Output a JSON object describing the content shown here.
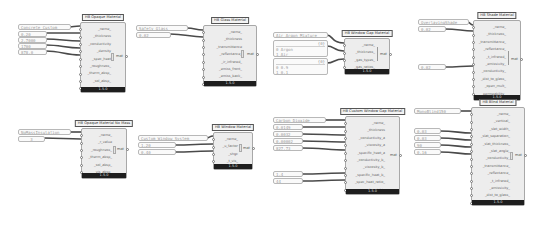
{
  "canvas": {
    "background": "#ffffff",
    "wire_color": "#4a4a4a"
  },
  "components": [
    {
      "id": "opaque",
      "title": "HB Opaque Material",
      "inputs": [
        "_name_",
        "_thickness",
        "_conductivity",
        "_density",
        "_spec_heat",
        "_roughness_",
        "_therm_absp_",
        "_sol_absp_",
        "_vis_absp_"
      ],
      "output": "mat",
      "version": "1.5.0"
    },
    {
      "id": "glass",
      "title": "HB Glass Material",
      "inputs": [
        "_name_",
        "_thickness",
        "_transmittance",
        "_reflectance_",
        "_ir_infrared_",
        "_emiss_front_",
        "_emiss_back_",
        "_conductivity_"
      ],
      "output": "mat",
      "version": "1.5.0"
    },
    {
      "id": "gap",
      "title": "HB Window Gap Material",
      "inputs": [
        "_name_",
        "_thickness_",
        "_gas_types_",
        "_gas_ratios_"
      ],
      "output": "mat",
      "version": "1.5.0"
    },
    {
      "id": "shade",
      "title": "HB Shade Material",
      "inputs": [
        "_name_",
        "_thickness_",
        "_transmittance_",
        "_reflectance_",
        "_t_infrared_",
        "_emissivity_",
        "_conductivity_",
        "_dist_to_glass_",
        "_open_mult_",
        "_permeability_"
      ],
      "output": "mat",
      "version": "1.5.0"
    },
    {
      "id": "opaque_nomass",
      "title": "HB Opaque Material No Mass",
      "inputs": [
        "_name_",
        "_r_value",
        "_roughness_",
        "_therm_absp_",
        "_sol_absp_",
        "_vis_absp_"
      ],
      "output": "mat",
      "version": "1.5.0"
    },
    {
      "id": "window",
      "title": "HB Window Material",
      "inputs": [
        "_name_",
        "_u_factor",
        "_shgc",
        "_t_vis_"
      ],
      "output": "mat",
      "version": "1.5.0"
    },
    {
      "id": "custom_gap",
      "title": "HB Custom Window Gap Material",
      "inputs": [
        "_name_",
        "_thickness",
        "_conductivity_a",
        "_viscosity_a",
        "_specific_heat_a",
        "_conductivity_b_",
        "_viscosity_b_",
        "_specific_heat_b_",
        "_spec_heat_ratio_",
        "_mol_weight_"
      ],
      "output": "mat",
      "version": "1.5.0"
    },
    {
      "id": "blind",
      "title": "HB Blind Material",
      "inputs": [
        "_name_",
        "_vertical_",
        "_slat_width_",
        "_slat_separation_",
        "_slat_thickness_",
        "_slat_angle_",
        "_conductivity_",
        "_transmittance_",
        "_reflectance_",
        "_t_infrared_",
        "_emissivity_",
        "_dist_to_glass_",
        "_open_mult_"
      ],
      "output": "mat",
      "version": "1.5.0"
    }
  ],
  "panels": {
    "opaque": [
      "Concrete Custom",
      "0.20",
      "2.7000",
      "1700",
      "878.0"
    ],
    "glass": [
      "Safety Glass",
      "0.02"
    ],
    "gap_name": "Air Argon Mixture",
    "gap_types": {
      "index": "{0}",
      "items": [
        "0 Argon",
        "1 Air"
      ]
    },
    "gap_ratios": {
      "index": "{0}",
      "items": [
        "0 0.9",
        "1 0.1"
      ]
    },
    "shade": [
      "OverlayingShade",
      "0.02",
      "0.02"
    ],
    "opaque_nomass": [
      "NoMassInsulation",
      "3"
    ],
    "window": [
      "Custom Window System",
      "1.20",
      "0.40"
    ],
    "custom_gap": [
      "Carbon Dioxide",
      "0.0149",
      "0.0032",
      "0.00002",
      "827.73",
      "1.4",
      "44"
    ],
    "blind": [
      "MonoBlind150",
      "0.03",
      "0.03",
      "90",
      "0.16"
    ]
  }
}
